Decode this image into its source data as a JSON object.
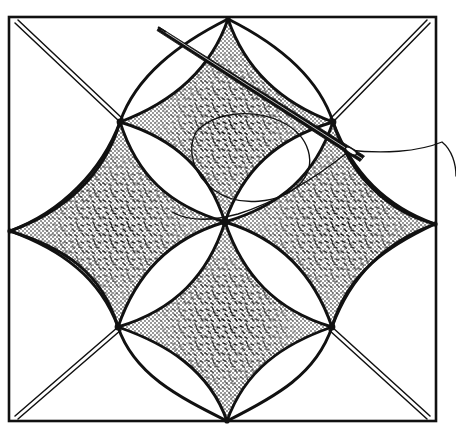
{
  "figure": {
    "title": "Needlework pattern diagram: four-petal rosette lattice with needle and thread",
    "width": 456,
    "height": 432,
    "background_color": "#ffffff",
    "ink_color": "#111111",
    "stipple_color": "#1a1a1a",
    "paper_tone": "#fdfdfc"
  },
  "frame": {
    "name": "outer-border-rectangle",
    "x": 9,
    "y": 17,
    "width": 427,
    "height": 404,
    "stroke_width": 2.6,
    "stroke_color": "#111111"
  },
  "nodes": [
    {
      "id": "top-left-node",
      "x": 120,
      "y": 122
    },
    {
      "id": "top-right-node",
      "x": 333,
      "y": 122
    },
    {
      "id": "bottom-left-node",
      "x": 118,
      "y": 327
    },
    {
      "id": "bottom-right-node",
      "x": 332,
      "y": 327
    },
    {
      "id": "center-node",
      "x": 225,
      "y": 222
    },
    {
      "id": "top-edge-node",
      "x": 228,
      "y": 19
    },
    {
      "id": "bottom-edge-node",
      "x": 227,
      "y": 421
    },
    {
      "id": "left-edge-node",
      "x": 10,
      "y": 231
    },
    {
      "id": "right-edge-node",
      "x": 435,
      "y": 224
    }
  ],
  "diagonals": [
    {
      "id": "diagonal-top-left",
      "from": "frame-corner-top-left",
      "to": "top-left-node",
      "x1": 16,
      "y1": 24,
      "x2": 120,
      "y2": 122
    },
    {
      "id": "diagonal-top-right",
      "from": "frame-corner-top-right",
      "to": "top-right-node",
      "x1": 429,
      "y1": 24,
      "x2": 333,
      "y2": 122
    },
    {
      "id": "diagonal-bottom-left",
      "from": "frame-corner-bottom-left",
      "to": "bottom-left-node",
      "x1": 16,
      "y1": 415,
      "x2": 118,
      "y2": 327
    },
    {
      "id": "diagonal-bottom-right",
      "from": "frame-corner-bottom-right",
      "to": "bottom-right-node",
      "x1": 429,
      "y1": 415,
      "x2": 332,
      "y2": 327
    }
  ],
  "petals": [
    {
      "id": "petal-upper-left",
      "from": "top-left-node",
      "to": "center-node"
    },
    {
      "id": "petal-upper-right",
      "from": "top-right-node",
      "to": "center-node"
    },
    {
      "id": "petal-lower-left",
      "from": "bottom-left-node",
      "to": "center-node"
    },
    {
      "id": "petal-lower-right",
      "from": "bottom-right-node",
      "to": "center-node"
    }
  ],
  "stipple_regions": [
    {
      "id": "stipple-top-diamond",
      "label": "upper concave diamond"
    },
    {
      "id": "stipple-left-diamond",
      "label": "left concave diamond"
    },
    {
      "id": "stipple-right-diamond",
      "label": "right concave diamond"
    },
    {
      "id": "stipple-bottom-diamond",
      "label": "lower concave diamond"
    }
  ],
  "needle": {
    "id": "sewing-needle",
    "tip_x": 160,
    "tip_y": 28,
    "eye_x": 362,
    "eye_y": 158,
    "body_width": 4.2,
    "label": "needle"
  },
  "thread": {
    "id": "sewing-thread",
    "label": "thread",
    "stroke_width": 1.4,
    "exit_x": 456,
    "exit_y": 176,
    "loop_label": "thread loop crossing upper diamond"
  },
  "caption": {
    "visible": false,
    "text": ""
  }
}
